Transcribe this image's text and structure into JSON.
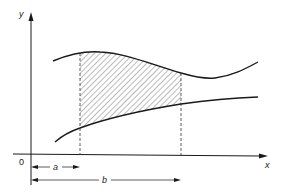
{
  "diagram": {
    "axes": {
      "x_label": "x",
      "y_label": "y",
      "origin_label": "0"
    },
    "curves": [
      {
        "name": "upper-curve",
        "description": "upper function curve, peak then dip then rise"
      },
      {
        "name": "lower-curve",
        "description": "lower function curve, increasing"
      }
    ],
    "shaded_region": {
      "from": "a",
      "to": "b",
      "fill": "diagonal hatching"
    },
    "dimensions": [
      {
        "label": "a",
        "from": "0",
        "to": "x = a"
      },
      {
        "label": "b",
        "from": "0",
        "to": "x = b"
      }
    ],
    "colors": {
      "line": "#1a1a1a",
      "hatch": "#555555",
      "background": "#ffffff"
    }
  }
}
